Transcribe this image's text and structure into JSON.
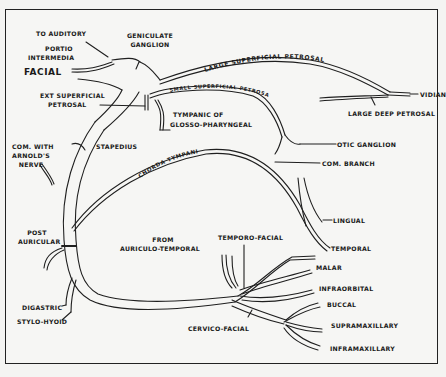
{
  "diagram": {
    "type": "anatomical-nerve-diagram",
    "labels": {
      "to_auditory": "TO AUDITORY",
      "portio_intermedia_1": "PORTIO",
      "portio_intermedia_2": "INTERMEDIA",
      "facial": "FACIAL",
      "geniculate_1": "GENICULATE",
      "geniculate_2": "GANGLION",
      "large_superficial_petrosal": "LARGE SUPERFICIAL PETROSAL",
      "small_superficial_petrosal": "SMALL SUPERFICIAL PETROSAL",
      "vidian": "VIDIAN",
      "large_deep_petrosal": "LARGE DEEP PETROSAL",
      "ext_superficial_petrosal_1": "EXT SUPERFICIAL",
      "ext_superficial_petrosal_2": "PETROSAL",
      "tympanic_1": "TYMPANIC OF",
      "tympanic_2": "GLOSSO-PHARYNGEAL",
      "com_with_arnolds_1": "COM. WITH",
      "com_with_arnolds_2": "ARNOLD'S",
      "com_with_arnolds_3": "NERVE",
      "stapedius": "STAPEDIUS",
      "chorda_tympani": "CHORDA TYMPANI",
      "otic_ganglion": "OTIC GANGLION",
      "com_branch": "COM. BRANCH",
      "lingual": "LINGUAL",
      "post_auricular_1": "POST",
      "post_auricular_2": "AURICULAR",
      "from_auriculo_temporal_1": "FROM",
      "from_auriculo_temporal_2": "AURICULO-TEMPORAL",
      "temporo_facial": "TEMPORO-FACIAL",
      "temporal": "TEMPORAL",
      "malar": "MALAR",
      "infraorbital": "INFRAORBITAL",
      "buccal": "BUCCAL",
      "supramaxillary": "SUPRAMAXILLARY",
      "inframaxillary": "INFRAMAXILLARY",
      "digastric": "DIGASTRIC",
      "stylo_hyoid": "STYLO-HYOID",
      "cervico_facial": "CERVICO-FACIAL"
    }
  }
}
